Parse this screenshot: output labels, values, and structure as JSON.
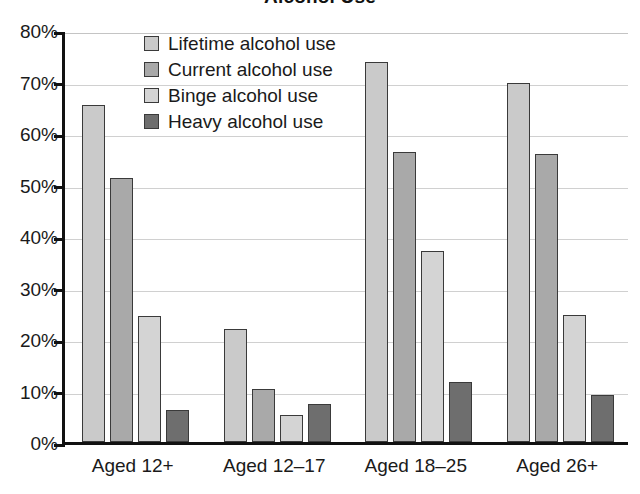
{
  "chart_data": {
    "type": "bar",
    "title": "Alcohol Use",
    "xlabel": "",
    "ylabel": "",
    "ylim": [
      0,
      80
    ],
    "ytick_labels": [
      "80%",
      "70%",
      "60%",
      "50%",
      "40%",
      "30%",
      "20%",
      "10%",
      "0%"
    ],
    "ytick_values": [
      80,
      70,
      60,
      50,
      40,
      30,
      20,
      10,
      0
    ],
    "grid": true,
    "legend_position": "inside-top-left",
    "categories": [
      "Aged 12+",
      "Aged 12–17",
      "Aged 18–25",
      "Aged 26+"
    ],
    "series": [
      {
        "name": "Lifetime alcohol use",
        "color": "#cacaca",
        "values": [
          65.5,
          21.9,
          73.8,
          69.7
        ]
      },
      {
        "name": "Current alcohol use",
        "color": "#a9a9a9",
        "values": [
          51.2,
          10.2,
          56.3,
          55.9
        ]
      },
      {
        "name": "Binge alcohol use",
        "color": "#d4d4d4",
        "values": [
          24.4,
          5.3,
          37.0,
          24.7
        ]
      },
      {
        "name": "Heavy alcohol use",
        "color": "#6e6e6e",
        "values": [
          6.2,
          7.3,
          11.6,
          9.2
        ]
      }
    ]
  },
  "axes": {
    "axis_color": "#111111",
    "gridline_color": "#d0d0d0",
    "bar_outline_color": "#3a3a3a"
  }
}
